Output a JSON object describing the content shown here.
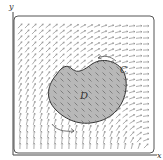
{
  "figure": {
    "axis_labels": {
      "x": "x",
      "y": "y"
    },
    "region_label": "D",
    "curve_label": "C",
    "colors": {
      "frame": "#555555",
      "axis": "#444444",
      "arrow": "#8a8a8a",
      "region_fill": "#b8b8b8",
      "region_stroke": "#333333",
      "background": "#ffffff"
    }
  }
}
